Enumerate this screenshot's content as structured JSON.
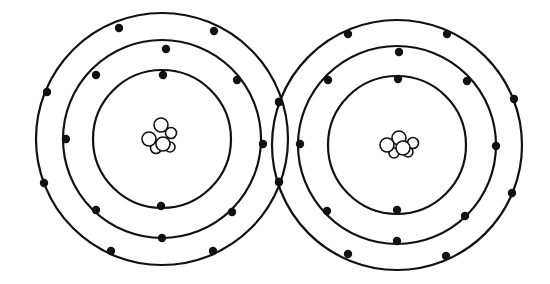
{
  "diagram": {
    "title": "",
    "colors": {
      "stroke": "#111111",
      "background": "#ffffff",
      "nucleus_fill": "#ffffff"
    },
    "atoms": [
      {
        "name": "left-atom",
        "center": [
          162,
          139
        ],
        "shells": [
          {
            "radius": 69,
            "electrons": [
              [
                163,
                75
              ],
              [
                161,
                206
              ]
            ]
          },
          {
            "radius": 99,
            "electrons": [
              [
                166,
                49
              ],
              [
                96,
                75
              ],
              [
                237,
                80
              ],
              [
                66,
                139
              ],
              [
                263,
                144
              ],
              [
                96,
                210
              ],
              [
                232,
                212
              ],
              [
                162,
                238
              ]
            ]
          },
          {
            "radius": 126,
            "electrons": [
              [
                119,
                28
              ],
              [
                214,
                31
              ],
              [
                47,
                92
              ],
              [
                279,
                102
              ],
              [
                44,
                183
              ],
              [
                279,
                182
              ],
              [
                111,
                251
              ],
              [
                213,
                251
              ]
            ]
          }
        ],
        "nucleus": [
          [
            161,
            125,
            7
          ],
          [
            149,
            139,
            7
          ],
          [
            171,
            133,
            5.5
          ],
          [
            163,
            144,
            7
          ],
          [
            156,
            148,
            5.5
          ],
          [
            170,
            147,
            5
          ]
        ]
      },
      {
        "name": "right-atom",
        "center": [
          397,
          145
        ],
        "shells": [
          {
            "radius": 69,
            "electrons": [
              [
                398,
                79
              ],
              [
                397,
                210
              ]
            ]
          },
          {
            "radius": 99,
            "electrons": [
              [
                399,
                52
              ],
              [
                328,
                80
              ],
              [
                467,
                81
              ],
              [
                300,
                144
              ],
              [
                496,
                146
              ],
              [
                327,
                211
              ],
              [
                465,
                216
              ],
              [
                397,
                241
              ]
            ]
          },
          {
            "radius": 125,
            "electrons": [
              [
                348,
                34
              ],
              [
                447,
                34
              ],
              [
                514,
                99
              ],
              [
                279,
                102
              ],
              [
                512,
                193
              ],
              [
                279,
                182
              ],
              [
                348,
                254
              ],
              [
                446,
                256
              ]
            ]
          }
        ],
        "nucleus": [
          [
            399,
            138,
            7
          ],
          [
            387,
            145,
            7
          ],
          [
            413,
            143,
            5.5
          ],
          [
            403,
            148,
            7
          ],
          [
            394,
            153,
            5
          ],
          [
            408,
            152,
            5
          ]
        ]
      }
    ]
  }
}
